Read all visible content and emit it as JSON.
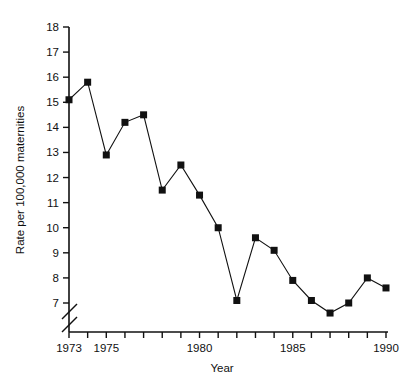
{
  "chart_data": {
    "type": "line",
    "title": "",
    "xlabel": "Year",
    "ylabel": "Rate per 100,000 maternities",
    "x": [
      1973,
      1974,
      1975,
      1976,
      1977,
      1978,
      1979,
      1980,
      1981,
      1982,
      1983,
      1984,
      1985,
      1986,
      1987,
      1988,
      1989,
      1990
    ],
    "values": [
      15.1,
      15.8,
      12.9,
      14.2,
      14.5,
      11.5,
      12.5,
      11.3,
      10.0,
      7.1,
      9.6,
      9.1,
      7.9,
      7.1,
      6.6,
      7.0,
      8.0,
      7.6
    ],
    "series": [
      {
        "name": "Rate per 100,000 maternities",
        "values": [
          15.1,
          15.8,
          12.9,
          14.2,
          14.5,
          11.5,
          12.5,
          11.3,
          10.0,
          7.1,
          9.6,
          9.1,
          7.9,
          7.1,
          6.6,
          7.0,
          8.0,
          7.6
        ]
      }
    ],
    "xlim": [
      1973,
      1990
    ],
    "ylim": [
      7,
      18
    ],
    "yticks": [
      7,
      8,
      9,
      10,
      11,
      12,
      13,
      14,
      15,
      16,
      17,
      18
    ],
    "ytick_labels": [
      "7",
      "8",
      "9",
      "10",
      "11",
      "12",
      "13",
      "14",
      "15",
      "16",
      "17",
      "18"
    ],
    "xticks": [
      1973,
      1974,
      1975,
      1976,
      1977,
      1978,
      1979,
      1980,
      1981,
      1982,
      1983,
      1984,
      1985,
      1986,
      1987,
      1988,
      1989,
      1990
    ],
    "xtick_labels_shown": [
      "1973",
      "1975",
      "1980",
      "1985",
      "1990"
    ],
    "xtick_label_years": [
      1973,
      1975,
      1980,
      1985,
      1990
    ],
    "grid": false,
    "legend": false,
    "legend_position": "none",
    "marker": "filled-square",
    "marker_color": "#111111",
    "line_color": "#111111",
    "axis_color": "#111111",
    "background_color": "#ffffff",
    "y_axis_break": true,
    "y_axis_break_note": "axis broken below 7"
  }
}
